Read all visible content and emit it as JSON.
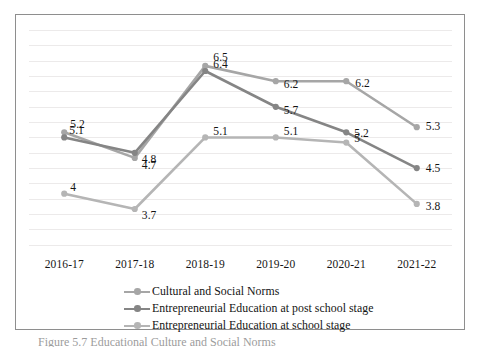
{
  "chart_data": {
    "type": "line",
    "title": "",
    "subtitle": "",
    "xlabel": "",
    "ylabel": "",
    "categories": [
      "2016-17",
      "2017-18",
      "2018-19",
      "2019-20",
      "2020-21",
      "2021-22"
    ],
    "ylim": [
      2.8,
      7.3
    ],
    "grid": true,
    "gridlines": [
      3.0,
      3.3,
      3.6,
      3.9,
      4.2,
      4.5,
      4.8,
      5.1,
      5.4,
      5.7,
      6.0,
      6.3,
      6.6,
      6.9,
      7.2
    ],
    "legend_position": "bottom",
    "data_labels": true,
    "series": [
      {
        "name": "Cultural and Social Norms",
        "color": "#a6a6a6",
        "values": [
          5.2,
          4.7,
          6.5,
          6.2,
          6.2,
          5.3
        ],
        "labels": [
          "5.2",
          "4.7",
          "6.5",
          "6.2",
          "6.2",
          "5.3"
        ]
      },
      {
        "name": "Entrepreneurial Education at post school stage",
        "color": "#858585",
        "values": [
          5.1,
          4.8,
          6.4,
          5.7,
          5.2,
          4.5
        ],
        "labels": [
          "5.1",
          "4.8",
          "6.4",
          "5.7",
          "5.2",
          "4.5"
        ]
      },
      {
        "name": "Entrepreneurial Education at school stage",
        "color": "#b5b5b5",
        "values": [
          4.0,
          3.7,
          5.1,
          5.1,
          5.0,
          3.8
        ],
        "labels": [
          "4",
          "3.7",
          "5.1",
          "5.1",
          "5",
          "3.8"
        ]
      }
    ]
  },
  "legend": {
    "items": [
      {
        "label": "Cultural and Social Norms",
        "color": "#a6a6a6"
      },
      {
        "label": "Entrepreneurial Education at post school stage",
        "color": "#858585"
      },
      {
        "label": "Entrepreneurial Education at school stage",
        "color": "#b5b5b5"
      }
    ]
  },
  "caption": {
    "text": "Figure 5.7   Educational Culture and Social Norms"
  },
  "colors": {
    "frame_border": "#8e8e8e",
    "gridline": "#eceaea",
    "label_text": "#141414",
    "background": "#ffffff"
  }
}
